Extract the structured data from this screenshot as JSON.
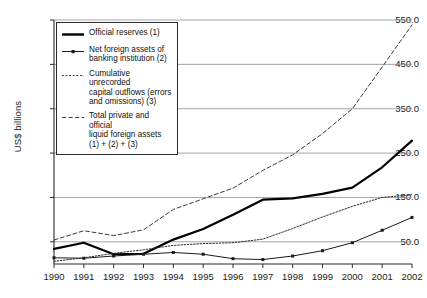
{
  "chart_data": {
    "type": "line",
    "title": "",
    "xlabel": "",
    "ylabel": "US$ billions",
    "x": [
      1990,
      1991,
      1992,
      1993,
      1994,
      1995,
      1996,
      1997,
      1998,
      1999,
      2000,
      2001,
      2002
    ],
    "xticklabels": [
      "1990",
      "1991",
      "1992",
      "1993",
      "1994",
      "1995",
      "1996",
      "1997",
      "1998",
      "1999",
      "2000",
      "2001",
      "2002"
    ],
    "yticks": [
      50.0,
      150.0,
      250.0,
      350.0,
      450.0,
      550.0
    ],
    "yticklabels": [
      "50.0",
      "150.0",
      "250.0",
      "350.0",
      "450.0",
      "550.0"
    ],
    "ylim": [
      0,
      550
    ],
    "xlim": [
      1990,
      2002
    ],
    "grid": "horizontal",
    "legend_position": "upper-left-inside",
    "series": [
      {
        "name": "Official reserves (1)",
        "key": "official_reserves",
        "style": "solid-thick",
        "marker": "none",
        "color": "#000000",
        "values": [
          34,
          48,
          22,
          23,
          55,
          79,
          111,
          145,
          148,
          158,
          172,
          218,
          278
        ]
      },
      {
        "name": "Net foreign assets of banking institution (2)",
        "key": "net_foreign_assets",
        "style": "solid-thin",
        "marker": "dot",
        "color": "#1a1a1a",
        "values": [
          14,
          13,
          18,
          22,
          26,
          22,
          12,
          10,
          18,
          30,
          48,
          76,
          105
        ]
      },
      {
        "name": "Cumulative unrecorded capital outflows (errors and omissions) (3)",
        "key": "cumulative_unrecorded_outflows",
        "style": "dotted",
        "marker": "none",
        "color": "#2b2b2b",
        "values": [
          6,
          14,
          24,
          32,
          42,
          46,
          48,
          56,
          80,
          106,
          130,
          150,
          156
        ]
      },
      {
        "name": "Total private and official liquid foreign assets (1) + (2) + (3)",
        "key": "total_liquid_foreign_assets",
        "style": "dashed",
        "marker": "none",
        "color": "#3a3a3a",
        "values": [
          54,
          75,
          64,
          77,
          123,
          147,
          171,
          211,
          246,
          294,
          350,
          444,
          539
        ]
      }
    ]
  },
  "legend": {
    "items": [
      {
        "label": "Official reserves (1)",
        "style": "solid-thick"
      },
      {
        "label": "Net foreign assets of\nbanking institution (2)",
        "style": "solid-thin-dot"
      },
      {
        "label": "Cumulative unrecorded\ncapital outflows (errors\nand omissions) (3)",
        "style": "dotted"
      },
      {
        "label": "Total private and official\nliquid foreign assets\n(1) + (2) + (3)",
        "style": "dashed"
      }
    ]
  }
}
